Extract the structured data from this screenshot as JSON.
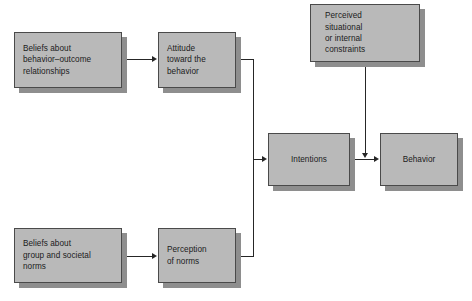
{
  "diagram": {
    "style": {
      "box_fill": "#b9b9b9",
      "box_border": "#4a4a4a",
      "box_shadow": "#8e8e8e",
      "line_color": "#262626",
      "text_color": "#1b1b1b",
      "background": "#ffffff"
    },
    "nodes": [
      {
        "id": "beliefs-behavior-outcome",
        "label": "Beliefs about\nbehavior–outcome\nrelationships",
        "x": 14,
        "y": 32,
        "w": 108,
        "h": 56,
        "align": "pad-left"
      },
      {
        "id": "attitude-toward-behavior",
        "label": "Attitude\ntoward the\nbehavior",
        "x": 158,
        "y": 32,
        "w": 78,
        "h": 56,
        "align": "pad-left"
      },
      {
        "id": "perceived-constraints",
        "label": "Perceived\nsituational\nor internal\nconstraints",
        "x": 310,
        "y": 4,
        "w": 110,
        "h": 58,
        "align": "pad-mid"
      },
      {
        "id": "intentions",
        "label": "Intentions",
        "x": 268,
        "y": 133,
        "w": 82,
        "h": 53,
        "align": "pad-ctr"
      },
      {
        "id": "behavior",
        "label": "Behavior",
        "x": 380,
        "y": 133,
        "w": 78,
        "h": 53,
        "align": "pad-ctr"
      },
      {
        "id": "beliefs-group-societal-norms",
        "label": "Beliefs about\ngroup and societal\nnorms",
        "x": 14,
        "y": 228,
        "w": 108,
        "h": 55,
        "align": "pad-left"
      },
      {
        "id": "perception-of-norms",
        "label": "Perception\nof norms",
        "x": 158,
        "y": 228,
        "w": 78,
        "h": 55,
        "align": "pad-left"
      }
    ],
    "edges": [
      {
        "id": "edge-beliefs-to-attitude",
        "from": "beliefs-behavior-outcome",
        "to": "attitude-toward-behavior"
      },
      {
        "id": "edge-attitude-to-intentions",
        "from": "attitude-toward-behavior",
        "to": "intentions"
      },
      {
        "id": "edge-norms-beliefs-to-perception",
        "from": "beliefs-group-societal-norms",
        "to": "perception-of-norms"
      },
      {
        "id": "edge-perception-to-intentions",
        "from": "perception-of-norms",
        "to": "intentions"
      },
      {
        "id": "edge-intentions-to-behavior",
        "from": "intentions",
        "to": "behavior"
      },
      {
        "id": "edge-constraints-to-intentions-behavior",
        "from": "perceived-constraints",
        "to": "edge-intentions-to-behavior"
      }
    ]
  }
}
